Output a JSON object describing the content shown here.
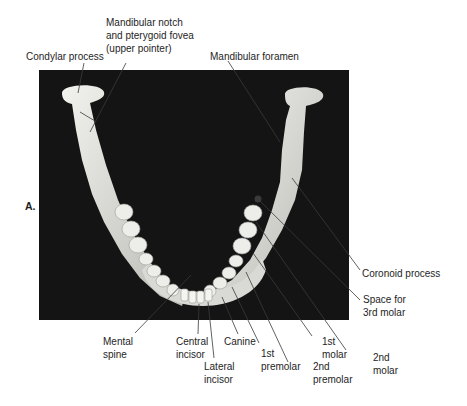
{
  "figure": {
    "panel_label": "A.",
    "labels": {
      "condylar_process": [
        "Condylar process"
      ],
      "mandibular_notch": [
        "Mandibular notch",
        "and pterygoid fovea",
        "(upper pointer)"
      ],
      "mandibular_foramen": [
        "Mandibular foramen"
      ],
      "coronoid_process": [
        "Coronoid process"
      ],
      "space_3rd_molar": [
        "Space for",
        "3rd molar"
      ],
      "mental_spine": [
        "Mental",
        "spine"
      ],
      "central_incisor": [
        "Central",
        "incisor"
      ],
      "lateral_incisor": [
        "Lateral",
        "incisor"
      ],
      "canine": [
        "Canine"
      ],
      "first_premolar": [
        "1st",
        "premolar"
      ],
      "second_premolar": [
        "2nd",
        "premolar"
      ],
      "first_molar": [
        "1st",
        "molar"
      ],
      "second_molar": [
        "2nd",
        "molar"
      ]
    },
    "colors": {
      "background": "#ffffff",
      "photo_background": "#141414",
      "bone": "#e6e6e2",
      "bone_shadow": "#a9a9a5",
      "leader_line": "#3a3a3a",
      "text": "#1e1e1e"
    }
  }
}
